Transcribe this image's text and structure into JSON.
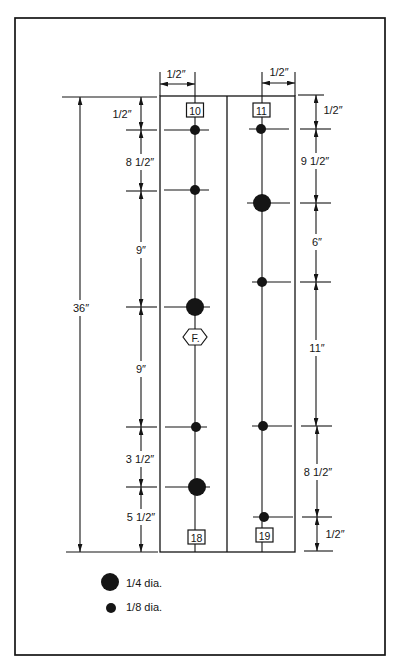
{
  "colors": {
    "ink": "#151515",
    "paper": "#ffffff"
  },
  "diagram": {
    "overall_length": "36″",
    "column_widths": {
      "left": "1/2″",
      "right": "1/2″"
    },
    "left_column": {
      "top_tag": "10",
      "bottom_tag": "18",
      "marker_tag": "F.",
      "spacings": [
        "1/2″",
        "8 1/2″",
        "9″",
        "9″",
        "3 1/2″",
        "5 1/2″"
      ],
      "holes": [
        {
          "dia": "1/8"
        },
        {
          "dia": "1/8"
        },
        {
          "dia": "1/4"
        },
        {
          "dia": "1/8"
        },
        {
          "dia": "1/4"
        }
      ]
    },
    "right_column": {
      "top_tag": "11",
      "bottom_tag": "19",
      "spacings": [
        "1/2″",
        "9 1/2″",
        "6″",
        "11″",
        "8 1/2″",
        "1/2″"
      ],
      "holes": [
        {
          "dia": "1/8"
        },
        {
          "dia": "1/4"
        },
        {
          "dia": "1/8"
        },
        {
          "dia": "1/8"
        },
        {
          "dia": "1/8"
        }
      ]
    }
  },
  "legend": {
    "items": [
      {
        "label": "1/4 dia.",
        "symbol": "large-dot"
      },
      {
        "label": "1/8 dia.",
        "symbol": "small-dot"
      }
    ]
  }
}
